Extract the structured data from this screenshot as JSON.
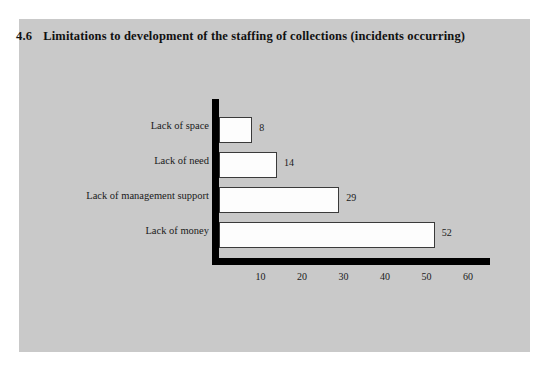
{
  "figure": {
    "number": "4.6",
    "title": "Limitations to development of the staffing of collections (incidents occurring)",
    "panel_color": "#c9c9c9",
    "page_color": "#ffffff",
    "axis_color": "#000000",
    "bar_fill": "#fdfdfd",
    "bar_border": "#3a3a3a"
  },
  "chart_data": {
    "type": "bar",
    "orientation": "horizontal",
    "title": "4.6  Limitations to development of the staffing of collections (incidents occurring)",
    "xlabel": "",
    "ylabel": "",
    "categories": [
      "Lack of space",
      "Lack of need",
      "Lack of management support",
      "Lack of money"
    ],
    "values": [
      8,
      14,
      29,
      52
    ],
    "value_labels": [
      "8",
      "14",
      "29",
      "52"
    ],
    "xlim": [
      0,
      60
    ],
    "xticks": [
      10,
      20,
      30,
      40,
      50,
      60
    ],
    "xtick_labels": [
      "10",
      "20",
      "30",
      "40",
      "50",
      "60"
    ],
    "grid": false,
    "legend": false
  }
}
